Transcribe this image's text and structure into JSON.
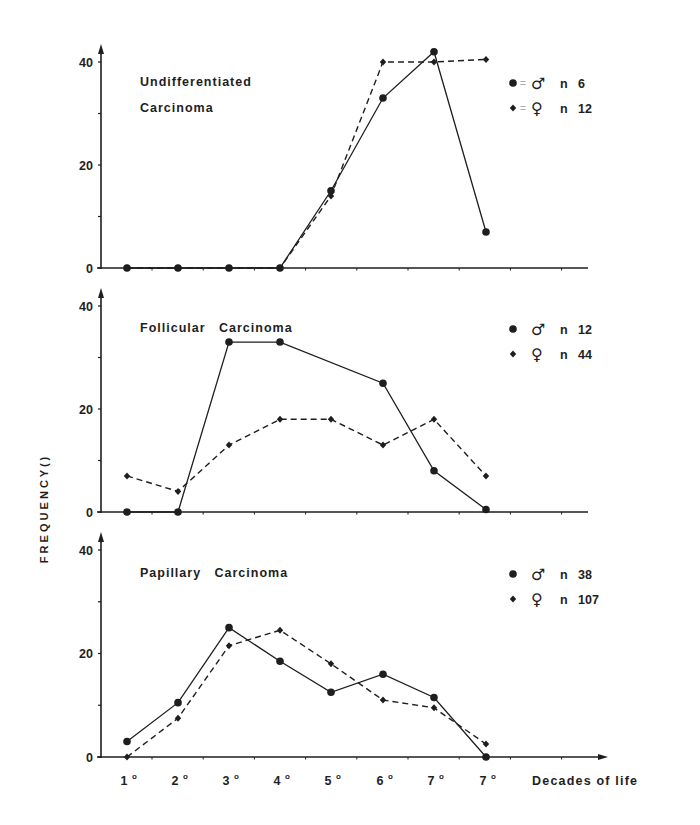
{
  "chart_data": [
    {
      "type": "line",
      "title": "Undifferentiated Carcinoma",
      "title_lines": [
        "Undifferentiated",
        "Carcinoma"
      ],
      "xlabel": "Decades of life",
      "ylabel": "FREQUENCY (%)",
      "categories": [
        "1°",
        "2°",
        "3°",
        "4°",
        "5°",
        "6°",
        "7°",
        "7°"
      ],
      "yticks": [
        0,
        20,
        40
      ],
      "ylim": [
        0,
        42
      ],
      "series": [
        {
          "name": "male",
          "symbol": "♂",
          "marker": "circle",
          "line": "solid",
          "n_label": "n = 6",
          "values": [
            0,
            0,
            0,
            0,
            15,
            33,
            42,
            7
          ]
        },
        {
          "name": "female",
          "symbol": "♀",
          "marker": "diamond",
          "line": "dashed",
          "n_label": "n = 12",
          "values": [
            0,
            0,
            0,
            0,
            14,
            40,
            40,
            40.5
          ]
        }
      ]
    },
    {
      "type": "line",
      "title": "Follicular Carcinoma",
      "title_lines": [
        "Follicular   Carcinoma"
      ],
      "xlabel": "Decades of life",
      "ylabel": "FREQUENCY (%)",
      "categories": [
        "1°",
        "2°",
        "3°",
        "4°",
        "5°",
        "6°",
        "7°",
        "7°"
      ],
      "yticks": [
        0,
        20,
        40
      ],
      "ylim": [
        0,
        42
      ],
      "series": [
        {
          "name": "male",
          "symbol": "♂",
          "marker": "circle",
          "line": "solid",
          "n_label": "n   12",
          "values": [
            0,
            0,
            33,
            33,
            null,
            25,
            8,
            0.5
          ]
        },
        {
          "name": "female",
          "symbol": "♀",
          "marker": "diamond",
          "line": "dashed",
          "n_label": "n   44",
          "values": [
            7,
            4,
            13,
            18,
            18,
            13,
            18,
            7
          ]
        }
      ]
    },
    {
      "type": "line",
      "title": "Papillary Carcinoma",
      "title_lines": [
        "Papillary   Carcinoma"
      ],
      "xlabel": "Decades of life",
      "ylabel": "FREQUENCY (%)",
      "categories": [
        "1°",
        "2°",
        "3°",
        "4°",
        "5°",
        "6°",
        "7°",
        "7°"
      ],
      "yticks": [
        0,
        20,
        40
      ],
      "ylim": [
        0,
        42
      ],
      "series": [
        {
          "name": "male",
          "symbol": "♂",
          "marker": "circle",
          "line": "solid",
          "n_label": "n   38",
          "values": [
            3,
            10.5,
            25,
            18.5,
            12.5,
            16,
            11.5,
            0
          ]
        },
        {
          "name": "female",
          "symbol": "♀",
          "marker": "diamond",
          "line": "dashed",
          "n_label": "n   107",
          "values": [
            0,
            7.5,
            21.5,
            24.5,
            18,
            11,
            9.5,
            2.5
          ]
        }
      ]
    }
  ],
  "axis": {
    "ylabel": "F R E Q U E N C Y  ( )",
    "xlabel": "Decades of life",
    "xticks": [
      "1°",
      "2°",
      "3°",
      "4°",
      "5°",
      "6°",
      "7°",
      "7°"
    ]
  },
  "legends": [
    {
      "male": {
        "symbol": "♂",
        "text": "n = 6",
        "sep": "="
      },
      "female": {
        "symbol": "♀",
        "text": "n = 12",
        "sep": "="
      }
    },
    {
      "male": {
        "symbol": "♂",
        "text": "n   12",
        "sep": ""
      },
      "female": {
        "symbol": "♀",
        "text": "n   44",
        "sep": ""
      }
    },
    {
      "male": {
        "symbol": "♂",
        "text": "n   38",
        "sep": ""
      },
      "female": {
        "symbol": "♀",
        "text": "n   107",
        "sep": ""
      }
    }
  ],
  "colors": {
    "ink": "#1e1e1e",
    "background": "#ffffff"
  }
}
